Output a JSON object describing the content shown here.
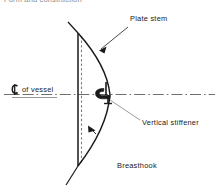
{
  "page": {
    "clipped_header_text": "Form and construction",
    "background_color": "#ffffff",
    "ink_color": "#1a1a1a"
  },
  "figure": {
    "type": "technical-line-drawing",
    "labels": {
      "plate_stem": "Plate stem",
      "vertical_stiffener": "Vertical stiffener",
      "breasthook": "Breasthook",
      "centerline_symbol": "℄",
      "centerline_text": "of vessel"
    }
  }
}
